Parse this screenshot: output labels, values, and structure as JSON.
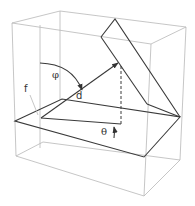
{
  "diagram": {
    "labels": {
      "phi": "φ",
      "d": "d",
      "f": "f",
      "theta": "θ"
    },
    "colors": {
      "background": "#ffffff",
      "box_edges": "#b8b8b8",
      "plane_edges": "#3a3a3a",
      "text": "#333333"
    }
  }
}
